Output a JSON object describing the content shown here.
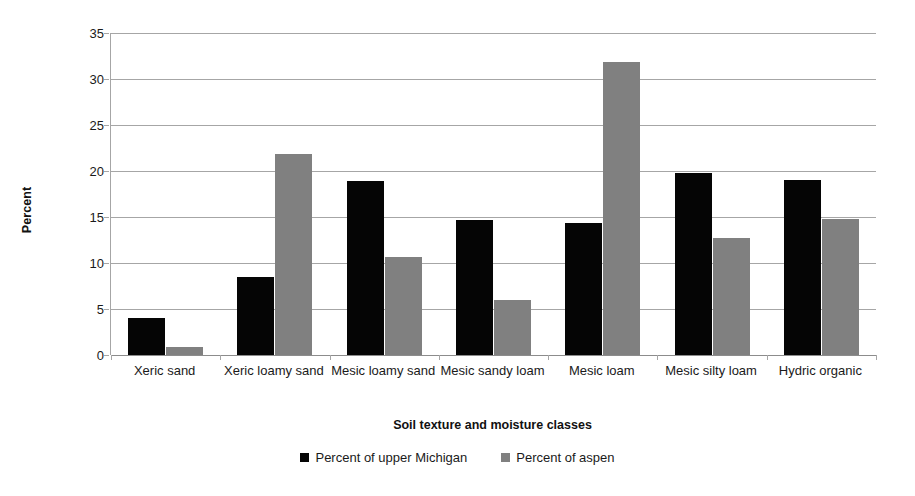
{
  "chart_data": {
    "type": "bar",
    "title": "",
    "xlabel": "Soil texture and moisture classes",
    "ylabel": "Percent",
    "ylim": [
      0,
      35
    ],
    "ytick_step": 5,
    "yticks": [
      0,
      5,
      10,
      15,
      20,
      25,
      30,
      35
    ],
    "grid": true,
    "legend_position": "bottom",
    "categories": [
      "Xeric sand",
      "Xeric loamy sand",
      "Mesic loamy sand",
      "Mesic sandy loam",
      "Mesic loam",
      "Mesic silty loam",
      "Hydric organic"
    ],
    "series": [
      {
        "name": "Percent of upper Michigan",
        "color": "#050505",
        "values": [
          4.0,
          8.5,
          18.9,
          14.7,
          14.4,
          19.8,
          19.0
        ]
      },
      {
        "name": "Percent of aspen",
        "color": "#808080",
        "values": [
          0.9,
          21.9,
          10.7,
          6.0,
          31.8,
          12.7,
          14.8
        ]
      }
    ]
  },
  "axes": {
    "y_title": "Percent",
    "x_title": "Soil texture and moisture classes",
    "y_tick_labels": [
      "0",
      "5",
      "10",
      "15",
      "20",
      "25",
      "30",
      "35"
    ],
    "x_tick_labels": [
      "Xeric sand",
      "Xeric loamy sand",
      "Mesic loamy sand",
      "Mesic sandy loam",
      "Mesic loam",
      "Mesic silty loam",
      "Hydric organic"
    ]
  },
  "legend": {
    "items": [
      {
        "label": "Percent of upper Michigan",
        "color": "#050505"
      },
      {
        "label": "Percent of aspen",
        "color": "#808080"
      }
    ]
  },
  "colors": {
    "series_0": "#050505",
    "series_1": "#808080",
    "gridline": "#a6a6a6",
    "background": "#ffffff"
  }
}
